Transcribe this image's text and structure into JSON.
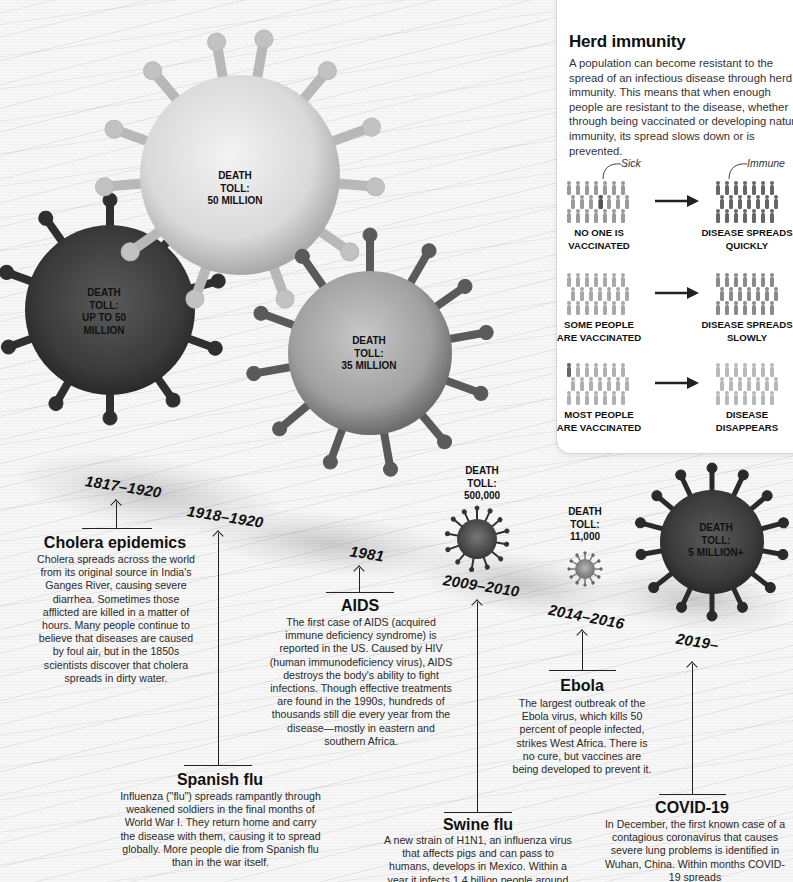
{
  "herd_immunity": {
    "title": "Herd immunity",
    "body": "A population can become resistant to the spread of an infectious disease through herd immunity. This means that when enough people are resistant to the disease, whether through being vaccinated or developing natural immunity, its spread slows down or is prevented.",
    "callouts": {
      "sick": "Sick",
      "immune": "Immune"
    },
    "rows": [
      {
        "left_caption_1": "NO ONE IS",
        "left_caption_2": "VACCINATED",
        "right_caption_1": "DISEASE SPREADS",
        "right_caption_2": "QUICKLY",
        "arrow_icon": "right-arrow-icon"
      },
      {
        "left_caption_1": "SOME PEOPLE",
        "left_caption_2": "ARE VACCINATED",
        "right_caption_1": "DISEASE SPREADS",
        "right_caption_2": "SLOWLY",
        "arrow_icon": "right-arrow-icon"
      },
      {
        "left_caption_1": "MOST PEOPLE",
        "left_caption_2": "ARE VACCINATED",
        "right_caption_1": "DISEASE",
        "right_caption_2": "DISAPPEARS",
        "arrow_icon": "right-arrow-icon"
      }
    ]
  },
  "viruses": [
    {
      "id": "spanish-flu",
      "toll_line1": "DEATH",
      "toll_line2": "TOLL:",
      "toll_line3": "50 MILLION",
      "color": "#d4d4d4"
    },
    {
      "id": "cholera",
      "toll_line1": "DEATH",
      "toll_line2": "TOLL:",
      "toll_line3": "UP TO 50",
      "toll_line4": "MILLION",
      "color": "#3a3a3a"
    },
    {
      "id": "aids",
      "toll_line1": "DEATH",
      "toll_line2": "TOLL:",
      "toll_line3": "35 MILLION",
      "color": "#a8a8a8"
    },
    {
      "id": "swine-flu",
      "toll_line1": "DEATH",
      "toll_line2": "TOLL:",
      "toll_line3": "500,000",
      "color": "#555555"
    },
    {
      "id": "ebola",
      "toll_line1": "DEATH",
      "toll_line2": "TOLL:",
      "toll_line3": "11,000",
      "color": "#8a8a8a"
    },
    {
      "id": "covid-19",
      "toll_line1": "DEATH",
      "toll_line2": "TOLL:",
      "toll_line3": "5 MILLION+",
      "color": "#3c3c3c"
    }
  ],
  "timeline": [
    {
      "years": "1817–1920",
      "title": "Cholera epidemics",
      "description": "Cholera spreads across the world from its original source in India's Ganges River, causing severe diarrhea. Sometimes those afflicted are killed in a matter of hours. Many people continue to believe that diseases are caused by foul air, but in the 1850s scientists discover that cholera spreads in dirty water."
    },
    {
      "years": "1918–1920",
      "title": "Spanish flu",
      "description": "Influenza (\"flu\") spreads rampantly through weakened soldiers in the final months of World War I. They return home and carry the disease with them, causing it to spread globally. More people die from Spanish flu than in the war itself."
    },
    {
      "years": "1981",
      "title": "AIDS",
      "description": "The first case of AIDS (acquired immune deficiency syndrome) is reported in the US. Caused by HIV (human immunodeficiency virus), AIDS destroys the body's ability to fight infections. Though effective treatments are found in the 1990s, hundreds of thousands still die every year from the disease—mostly in eastern and southern Africa."
    },
    {
      "years": "2009–2010",
      "title": "Swine flu",
      "description": "A new strain of H1N1, an influenza virus that affects pigs and can pass to humans, develops in Mexico. Within a year it infects 1.4 billion people around the world, killing hundreds of thousands."
    },
    {
      "years": "2014–2016",
      "title": "Ebola",
      "description": "The largest outbreak of the Ebola virus, which kills 50 percent of people infected, strikes West Africa. There is no cure, but vaccines are being developed to prevent it."
    },
    {
      "years": "2019–",
      "title": "COVID-19",
      "description": "In December, the first known case of a contagious coronavirus that causes severe lung problems is identified in Wuhan, China. Within months COVID-19 spreads"
    }
  ]
}
